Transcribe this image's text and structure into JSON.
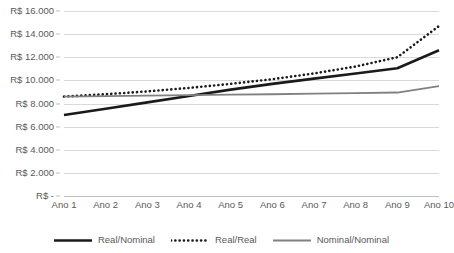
{
  "chart_data": {
    "type": "line",
    "title": "",
    "subtitle": "",
    "xlabel": "",
    "ylabel": "",
    "categories": [
      "Ano 1",
      "Ano 2",
      "Ano 3",
      "Ano 4",
      "Ano 5",
      "Ano 6",
      "Ano 7",
      "Ano 8",
      "Ano 9",
      "Ano 10"
    ],
    "ylim": [
      0,
      16000
    ],
    "y_ticks": [
      0,
      2000,
      4000,
      6000,
      8000,
      10000,
      12000,
      14000,
      16000
    ],
    "y_tick_labels": [
      "R$ -",
      "R$ 2.000",
      "R$ 4.000",
      "R$ 6.000",
      "R$ 8.000",
      "R$ 10.000",
      "R$ 12.000",
      "R$ 14.000",
      "R$ 16.000"
    ],
    "grid": true,
    "legend_position": "bottom",
    "series": [
      {
        "name": "Real/Nominal",
        "style": "solid-thick",
        "color": "#1a1a1a",
        "values": [
          7000,
          7550,
          8100,
          8650,
          9200,
          9700,
          10150,
          10600,
          11050,
          12600
        ]
      },
      {
        "name": "Real/Real",
        "style": "dotted",
        "color": "#1a1a1a",
        "values": [
          8600,
          8800,
          9050,
          9350,
          9700,
          10100,
          10600,
          11200,
          12000,
          14700
        ]
      },
      {
        "name": "Nominal/Nominal",
        "style": "solid-thin",
        "color": "#808080",
        "values": [
          8600,
          8640,
          8680,
          8720,
          8760,
          8800,
          8850,
          8900,
          8950,
          9500
        ]
      }
    ]
  },
  "axis": {
    "y_title": "",
    "x_title": ""
  },
  "legend": {
    "items": [
      {
        "label": "Real/Nominal"
      },
      {
        "label": "Real/Real"
      },
      {
        "label": "Nominal/Nominal"
      }
    ]
  },
  "colors": {
    "grid": "#d9d9d9",
    "baseline": "#bfbfbf",
    "text": "#595959",
    "series_dark": "#1a1a1a",
    "series_gray": "#808080",
    "background": "#ffffff"
  }
}
